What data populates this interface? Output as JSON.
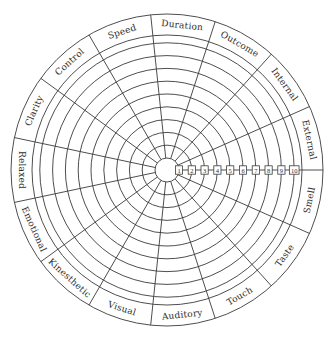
{
  "diagram": {
    "type": "wheel",
    "center": {
      "x": 167,
      "y": 170
    },
    "outer_radius": 156,
    "label_band_inner_radius": 135,
    "hub_radius": 12,
    "ring_step": 12.8,
    "ring_count": 10,
    "segment_angle_deg": 24,
    "line_color": "#3a3a3a",
    "text_color": "#2e2e2e",
    "scale": {
      "values": [
        "1",
        "2",
        "3",
        "4",
        "5",
        "6",
        "7",
        "8",
        "9",
        "10"
      ],
      "direction": "right"
    },
    "segments": [
      {
        "label": "External",
        "start_deg": 0,
        "end_deg": 24
      },
      {
        "label": "Internal",
        "start_deg": 24,
        "end_deg": 48
      },
      {
        "label": "Outcome",
        "start_deg": 48,
        "end_deg": 72
      },
      {
        "label": "Duration",
        "start_deg": 72,
        "end_deg": 96
      },
      {
        "label": "Speed",
        "start_deg": 96,
        "end_deg": 120
      },
      {
        "label": "Control",
        "start_deg": 120,
        "end_deg": 144
      },
      {
        "label": "Clarity",
        "start_deg": 144,
        "end_deg": 168
      },
      {
        "label": "Relaxed",
        "start_deg": 168,
        "end_deg": 192
      },
      {
        "label": "Emotional",
        "start_deg": 192,
        "end_deg": 216
      },
      {
        "label": "Kinesthetic",
        "start_deg": 216,
        "end_deg": 240
      },
      {
        "label": "Visual",
        "start_deg": 240,
        "end_deg": 264
      },
      {
        "label": "Auditory",
        "start_deg": 264,
        "end_deg": 288
      },
      {
        "label": "Touch",
        "start_deg": 288,
        "end_deg": 312
      },
      {
        "label": "Taste",
        "start_deg": 312,
        "end_deg": 336
      },
      {
        "label": "Smell",
        "start_deg": 336,
        "end_deg": 360
      }
    ]
  }
}
